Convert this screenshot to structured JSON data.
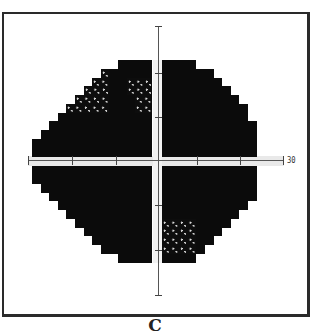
{
  "figure": {
    "caption": "C",
    "axis_label_right": "30",
    "colors": {
      "dense_defect": "#0b0b0b",
      "patterned": "#d8d8d8",
      "background": "#ffffff"
    }
  },
  "grid": {
    "cell_w": 8.6,
    "cell_h": 8.75,
    "top_origin_y": 60,
    "bottom_origin_y": 166,
    "left_origin_x": 32,
    "right_origin_x": 162,
    "top_left_rows": [
      {
        "start_col": 10,
        "end_col": 14,
        "pat": []
      },
      {
        "start_col": 8,
        "end_col": 14,
        "pat": [
          [
            8,
            9
          ]
        ]
      },
      {
        "start_col": 7,
        "end_col": 14,
        "pat": [
          [
            7,
            9
          ],
          [
            11,
            14
          ]
        ]
      },
      {
        "start_col": 6,
        "end_col": 14,
        "pat": [
          [
            6,
            9
          ],
          [
            11,
            14
          ]
        ]
      },
      {
        "start_col": 5,
        "end_col": 14,
        "pat": [
          [
            5,
            9
          ],
          [
            12,
            14
          ]
        ]
      },
      {
        "start_col": 4,
        "end_col": 14,
        "pat": [
          [
            4,
            9
          ],
          [
            12,
            14
          ]
        ]
      },
      {
        "start_col": 3,
        "end_col": 14,
        "pat": []
      },
      {
        "start_col": 2,
        "end_col": 14,
        "pat": []
      },
      {
        "start_col": 1,
        "end_col": 14,
        "pat": []
      },
      {
        "start_col": 0,
        "end_col": 14,
        "pat": []
      },
      {
        "start_col": 0,
        "end_col": 14,
        "pat": []
      }
    ],
    "top_right_rows": [
      {
        "start_col": 0,
        "end_col": 4,
        "pat": []
      },
      {
        "start_col": 0,
        "end_col": 6,
        "pat": []
      },
      {
        "start_col": 0,
        "end_col": 7,
        "pat": []
      },
      {
        "start_col": 0,
        "end_col": 8,
        "pat": []
      },
      {
        "start_col": 0,
        "end_col": 9,
        "pat": []
      },
      {
        "start_col": 0,
        "end_col": 10,
        "pat": []
      },
      {
        "start_col": 0,
        "end_col": 10,
        "pat": []
      },
      {
        "start_col": 0,
        "end_col": 11,
        "pat": []
      },
      {
        "start_col": 0,
        "end_col": 11,
        "pat": []
      },
      {
        "start_col": 0,
        "end_col": 11,
        "pat": []
      },
      {
        "start_col": 0,
        "end_col": 11,
        "pat": []
      }
    ],
    "bottom_left_rows": [
      {
        "start_col": 0,
        "end_col": 14,
        "pat": []
      },
      {
        "start_col": 0,
        "end_col": 14,
        "pat": []
      },
      {
        "start_col": 1,
        "end_col": 14,
        "pat": []
      },
      {
        "start_col": 2,
        "end_col": 14,
        "pat": []
      },
      {
        "start_col": 3,
        "end_col": 14,
        "pat": []
      },
      {
        "start_col": 4,
        "end_col": 14,
        "pat": []
      },
      {
        "start_col": 5,
        "end_col": 14,
        "pat": []
      },
      {
        "start_col": 6,
        "end_col": 14,
        "pat": []
      },
      {
        "start_col": 7,
        "end_col": 14,
        "pat": []
      },
      {
        "start_col": 8,
        "end_col": 14,
        "pat": []
      },
      {
        "start_col": 10,
        "end_col": 14,
        "pat": []
      }
    ],
    "bottom_right_rows": [
      {
        "start_col": 0,
        "end_col": 11,
        "pat": []
      },
      {
        "start_col": 0,
        "end_col": 11,
        "pat": []
      },
      {
        "start_col": 0,
        "end_col": 11,
        "pat": []
      },
      {
        "start_col": 0,
        "end_col": 11,
        "pat": []
      },
      {
        "start_col": 0,
        "end_col": 10,
        "pat": []
      },
      {
        "start_col": 0,
        "end_col": 9,
        "pat": []
      },
      {
        "start_col": 0,
        "end_col": 8,
        "pat": [
          [
            0,
            4
          ]
        ]
      },
      {
        "start_col": 0,
        "end_col": 7,
        "pat": [
          [
            0,
            4
          ]
        ]
      },
      {
        "start_col": 0,
        "end_col": 6,
        "pat": [
          [
            0,
            4
          ]
        ]
      },
      {
        "start_col": 0,
        "end_col": 5,
        "pat": [
          [
            0,
            4
          ]
        ]
      },
      {
        "start_col": 0,
        "end_col": 4,
        "pat": []
      }
    ]
  },
  "axes": {
    "h_ticks_x": [
      72,
      116,
      197,
      240
    ],
    "h_end_ticks_x": [
      28,
      283
    ],
    "v_ticks_y": [
      73,
      117,
      205,
      250
    ],
    "v_end_ticks_y": [
      26,
      295
    ]
  }
}
